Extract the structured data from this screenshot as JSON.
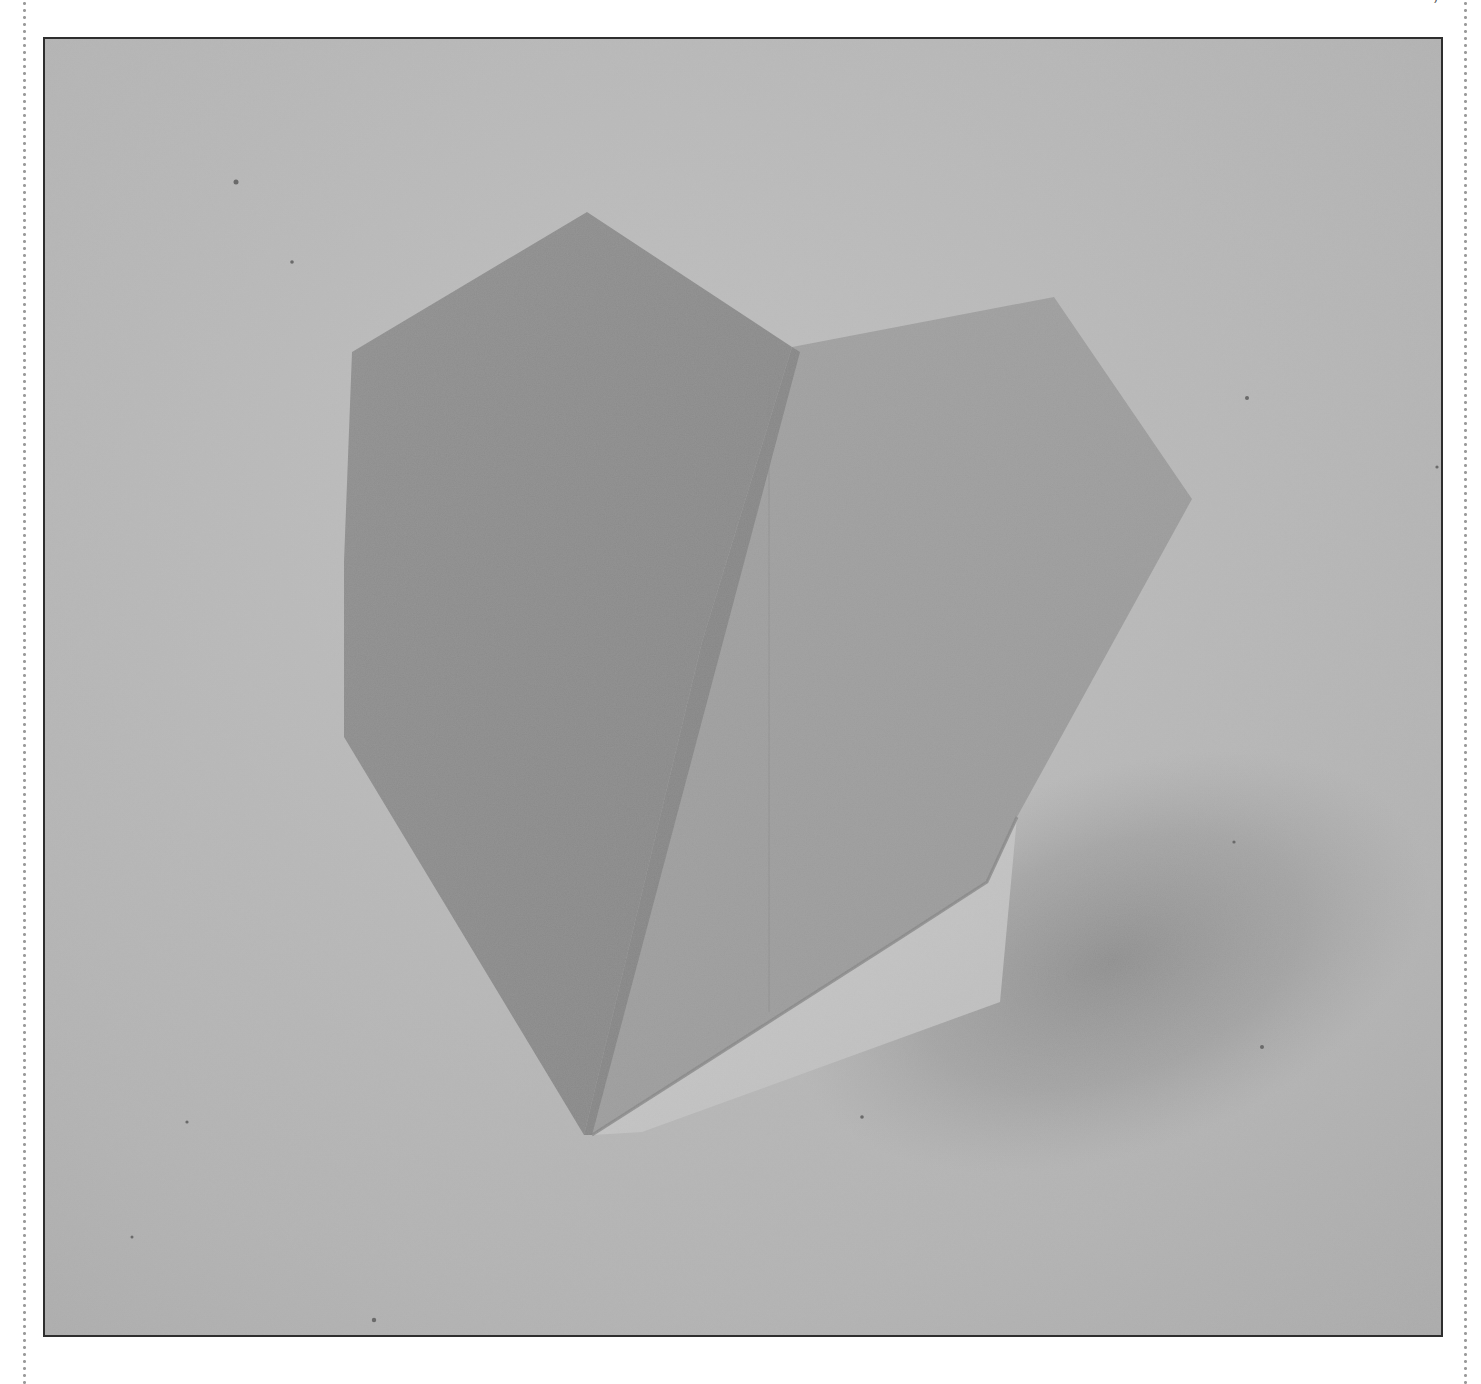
{
  "page": {
    "type": "book-figure-page",
    "caption_fragment_right": ")"
  },
  "figure": {
    "frame": {
      "border_color": "#2e2e2e",
      "background_color": "#b5b5b5"
    },
    "colors": {
      "background_light": "#bdbdbd",
      "background_shadow": "#8f8f8f",
      "left_face": "#8c8c8c",
      "right_face": "#9d9d9d",
      "underside_flap": "#c6c6c6",
      "crease_line": "#7a7a7a"
    }
  },
  "margins": {
    "left_rule": "dotted",
    "right_rule": "dotted"
  }
}
